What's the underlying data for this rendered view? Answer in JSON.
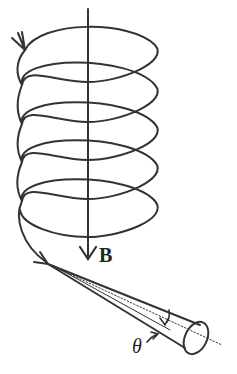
{
  "figure": {
    "labels": {
      "field": "B",
      "angle": "θ"
    },
    "colors": {
      "stroke": "#333333",
      "background": "#ffffff"
    },
    "helix_turns": 5
  }
}
